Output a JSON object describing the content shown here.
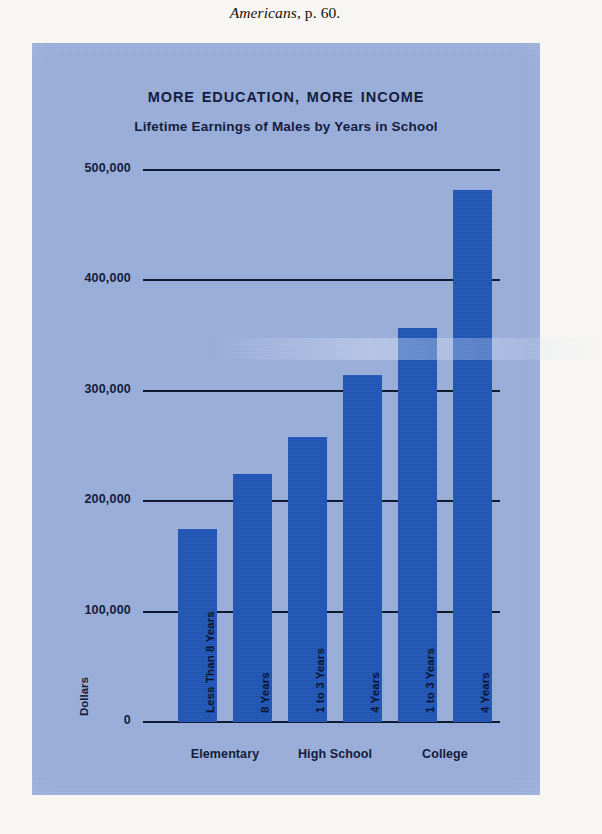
{
  "page": {
    "caption_italic": "Americans,",
    "caption_rest": " p. 60."
  },
  "chart": {
    "title": "MORE EDUCATION, MORE INCOME",
    "subtitle": "Lifetime Earnings of Males by Years in School",
    "y_axis_title": "Dollars",
    "colors": {
      "panel_background": "#94a9d7",
      "bar": "#1f55b6",
      "ink": "#131c3a",
      "page_background": "#f7f6f2"
    }
  },
  "chart_data": {
    "type": "bar",
    "title": "MORE EDUCATION, MORE INCOME",
    "subtitle": "Lifetime Earnings of Males by Years in School",
    "xlabel": "",
    "ylabel": "Dollars",
    "ylim": [
      0,
      500000
    ],
    "yticks": [
      0,
      100000,
      200000,
      300000,
      400000,
      500000
    ],
    "ytick_labels": [
      "0",
      "100,000",
      "200,000",
      "300,000",
      "400,000",
      "500,000"
    ],
    "grid": true,
    "legend": "none",
    "categories": [
      "Less Than 8 Years",
      "8 Years",
      "1 to 3 Years",
      "4 Years",
      "1 to 3 Years",
      "4 Years"
    ],
    "values": [
      175000,
      225000,
      258000,
      314000,
      357000,
      482000
    ],
    "groups": [
      {
        "label": "Elementary",
        "categories": [
          "Less Than 8 Years",
          "8 Years"
        ]
      },
      {
        "label": "High School",
        "categories": [
          "1 to 3 Years",
          "4 Years"
        ]
      },
      {
        "label": "College",
        "categories": [
          "1 to 3 Years",
          "4 Years"
        ]
      }
    ],
    "bars": [
      {
        "label": "Less Than 8 Years",
        "group": "Elementary",
        "value": 175000
      },
      {
        "label": "8 Years",
        "group": "Elementary",
        "value": 225000
      },
      {
        "label": "1 to 3 Years",
        "group": "High School",
        "value": 258000
      },
      {
        "label": "4 Years",
        "group": "High School",
        "value": 314000
      },
      {
        "label": "1 to 3 Years",
        "group": "College",
        "value": 357000
      },
      {
        "label": "4 Years",
        "group": "College",
        "value": 482000
      }
    ]
  }
}
